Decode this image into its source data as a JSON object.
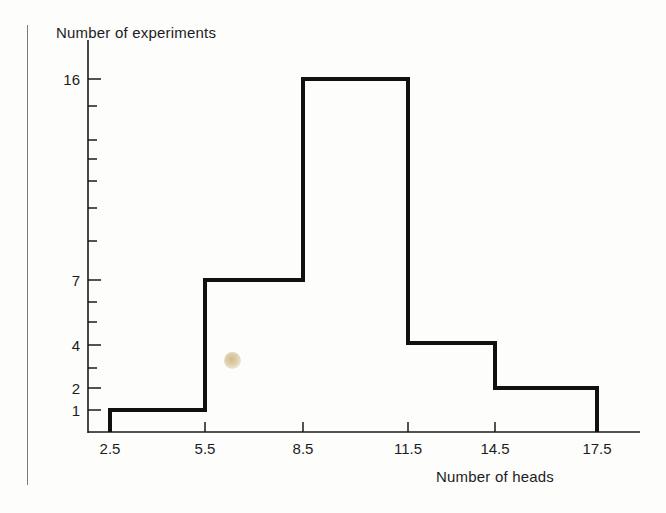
{
  "figure": {
    "background_color": "#fdfdfc",
    "ink_color": "#1a1a1a",
    "y_axis_title": "Number of experiments",
    "x_axis_title": "Number of heads",
    "page_rule_color": "#7c7c7c"
  },
  "chart_data": {
    "type": "bar",
    "title": "",
    "subtitle": "",
    "xlabel": "Number of heads",
    "ylabel": "Number of experiments",
    "style": "step-outline histogram (unfilled outline, no vertical bar separators drawn inside)",
    "bin_edges": [
      2.5,
      5.5,
      8.5,
      11.5,
      14.5,
      17.5
    ],
    "bin_width": 3,
    "categories": [
      "2.5-5.5",
      "5.5-8.5",
      "8.5-11.5",
      "11.5-14.5",
      "14.5-17.5"
    ],
    "bin_centers": [
      4,
      7,
      10,
      13,
      16
    ],
    "values": [
      1,
      7,
      16,
      4,
      2
    ],
    "total_experiments": 30,
    "xlim": [
      2.5,
      17.5
    ],
    "ylim": [
      0,
      16
    ],
    "x_tick_labels": [
      "2.5",
      "5.5",
      "8.5",
      "11.5",
      "14.5",
      "17.5"
    ],
    "x_tick_values": [
      2.5,
      5.5,
      8.5,
      11.5,
      14.5,
      17.5
    ],
    "y_tick_labels": [
      "16",
      "7",
      "4",
      "2",
      "1"
    ],
    "y_tick_values": [
      16,
      7,
      4,
      2,
      1
    ],
    "y_scale": "nonlinear (compressed toward large values)",
    "y_unlabeled_tick_values": [
      14,
      12,
      11,
      10,
      9,
      8,
      6,
      5,
      3
    ],
    "grid": false,
    "legend": null,
    "annotations": [
      {
        "name": "paper-smudge",
        "kind": "scan-artifact",
        "color": "#dbcaa6",
        "x_px": 232,
        "y_px": 360
      }
    ]
  },
  "geometry": {
    "plot_left_px": 88,
    "plot_baseline_px": 432,
    "plot_right_px": 640,
    "y_axis_top_px": 40,
    "x_tick_px": [
      110,
      205,
      303,
      408,
      495,
      597
    ],
    "y_tick_px": {
      "16": 79,
      "14": 106,
      "12": 140,
      "11": 159,
      "10": 181,
      "9": 208,
      "8": 241,
      "7": 280,
      "6": 302,
      "5": 322,
      "4": 345,
      "3": 368,
      "2": 388,
      "1": 410
    },
    "step_top_px": [
      410,
      280,
      79,
      343,
      388
    ],
    "page_rule_x_px": 27,
    "page_rule_top_px": 25,
    "page_rule_bottom_px": 485
  }
}
